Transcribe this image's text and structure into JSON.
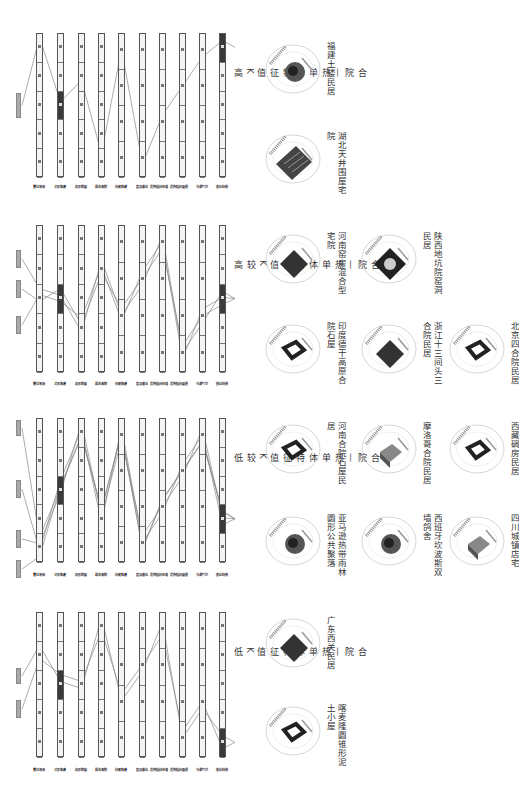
{
  "columns": [
    "场地位置",
    "建筑形式",
    "庭院形态",
    "院落布局",
    "建筑朝向",
    "出檐深度",
    "墙体材料/构造",
    "屋面材料/构造",
    "空气调节",
    "热特征值"
  ],
  "panels": [
    {
      "title": "合院—热单体特征值K高",
      "top": 33,
      "bottom": 177,
      "label_y": 185,
      "highlight": [
        [
          1,
          2
        ],
        [
          9,
          0
        ]
      ],
      "tags": [
        [
          93,
          118
        ]
      ]
    },
    {
      "title": "合院—热单体特征值K较高",
      "top": 225,
      "bottom": 372,
      "label_y": 382,
      "highlight": [
        [
          1,
          2
        ],
        [
          9,
          2
        ]
      ],
      "tags": [
        [
          250,
          268
        ],
        [
          280,
          298
        ],
        [
          316,
          334
        ]
      ]
    },
    {
      "title": "合院—热单体特征值K较低",
      "top": 418,
      "bottom": 562,
      "label_y": 573,
      "highlight": [
        [
          1,
          2
        ],
        [
          9,
          3
        ]
      ],
      "tags": [
        [
          420,
          436
        ],
        [
          480,
          498
        ],
        [
          530,
          548
        ],
        [
          560,
          578
        ]
      ]
    },
    {
      "title": "合院—热单体特征值K低",
      "top": 612,
      "bottom": 757,
      "label_y": 768,
      "highlight": [
        [
          1,
          2
        ],
        [
          9,
          4
        ]
      ],
      "tags": [
        [
          668,
          684
        ],
        [
          700,
          718
        ]
      ]
    }
  ],
  "buildings": [
    {
      "name": "福建土楼民居",
      "x": 262,
      "y": 38,
      "style": "round"
    },
    {
      "name": "湖北天井围屋宅院",
      "x": 262,
      "y": 128,
      "style": "grid"
    },
    {
      "name": "河南窑房混合型宅院",
      "x": 262,
      "y": 228,
      "style": "dark"
    },
    {
      "name": "印度德干高原合院石屋",
      "x": 262,
      "y": 318,
      "style": "court"
    },
    {
      "name": "陕西地坑院窑洞民居",
      "x": 358,
      "y": 228,
      "style": "pit"
    },
    {
      "name": "浙江十三间头三合院民居",
      "x": 358,
      "y": 318,
      "style": "dark"
    },
    {
      "name": "北京四合院民居",
      "x": 446,
      "y": 318,
      "style": "court"
    },
    {
      "name": "河南合院石屋民居",
      "x": 262,
      "y": 418,
      "style": "court"
    },
    {
      "name": "亚马逊热带雨林圆形公共聚落",
      "x": 262,
      "y": 510,
      "style": "round"
    },
    {
      "name": "摩洛哥合院民居",
      "x": 358,
      "y": 418,
      "style": "box"
    },
    {
      "name": "西班牙坎波斯双墙鸽舍",
      "x": 358,
      "y": 510,
      "style": "round"
    },
    {
      "name": "西藏碉房民居",
      "x": 446,
      "y": 418,
      "style": "court"
    },
    {
      "name": "四川城镇店宅",
      "x": 446,
      "y": 510,
      "style": "box"
    },
    {
      "name": "广东西关民居",
      "x": 262,
      "y": 612,
      "style": "dark"
    },
    {
      "name": "喀麦隆圆锥形泥土小屋",
      "x": 262,
      "y": 700,
      "style": "court"
    }
  ],
  "colors": {
    "dark": "#3a3a3a",
    "bar_fill": "#f4f4f4",
    "line": "#888888",
    "tag": "#aaaaaa"
  }
}
